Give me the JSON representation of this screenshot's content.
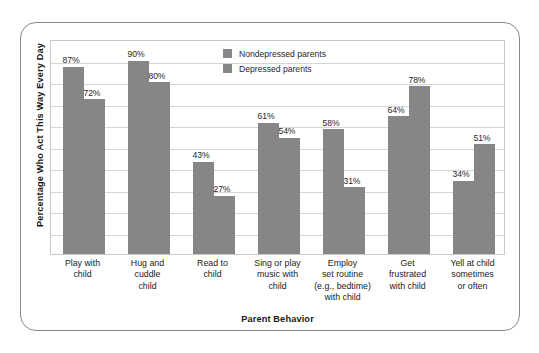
{
  "chart_data": {
    "type": "bar",
    "title": "",
    "xlabel": "Parent Behavior",
    "ylabel": "Percentage Who Act This Way Every Day",
    "ylim": [
      0,
      100
    ],
    "grid": true,
    "grid_step": 10,
    "legend_position": "top-center",
    "categories": [
      "Play with child",
      "Hug and cuddle child",
      "Read to child",
      "Sing or play music with child",
      "Employ set routine (e.g., bedtime) with child",
      "Get frustrated with child",
      "Yell at child sometimes or often"
    ],
    "category_lines": [
      [
        "Play with",
        "child"
      ],
      [
        "Hug and",
        "cuddle",
        "child"
      ],
      [
        "Read to",
        "child"
      ],
      [
        "Sing or play",
        "music with",
        "child"
      ],
      [
        "Employ",
        "set routine",
        "(e.g., bedtime)",
        "with child"
      ],
      [
        "Get",
        "frustrated",
        "with child"
      ],
      [
        "Yell at child",
        "sometimes",
        "or often"
      ]
    ],
    "series": [
      {
        "name": "Nondepressed parents",
        "color": "#868686",
        "values": [
          87,
          90,
          43,
          61,
          58,
          64,
          34
        ],
        "labels": [
          "87%",
          "90%",
          "43%",
          "61%",
          "58%",
          "64%",
          "34%"
        ]
      },
      {
        "name": "Depressed parents",
        "color": "#868686",
        "values": [
          72,
          80,
          27,
          54,
          31,
          78,
          51
        ],
        "labels": [
          "72%",
          "80%",
          "27%",
          "54%",
          "31%",
          "78%",
          "51%"
        ]
      }
    ]
  },
  "legend": {
    "entries": [
      {
        "label": "Nondepressed parents"
      },
      {
        "label": "Depressed parents"
      }
    ]
  },
  "colors": {
    "bar": "#868686",
    "grid": "#d5d5d5",
    "plot_border": "#c9c9c9",
    "frame_border": "#8a8a8a",
    "text": "#1a1a1a",
    "background": "#ffffff"
  }
}
